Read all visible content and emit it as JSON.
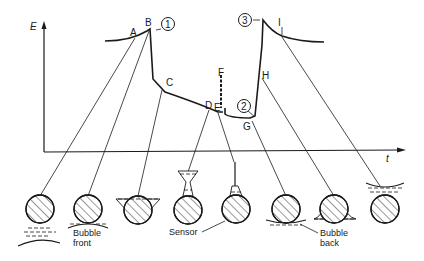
{
  "diagram": {
    "axes": {
      "y_label": "E",
      "x_label": "t"
    },
    "curve_points": [
      "A",
      "B",
      "C",
      "D",
      "E",
      "F",
      "G",
      "H",
      "I"
    ],
    "stage_markers": [
      "1",
      "2",
      "3"
    ],
    "captions": {
      "bubble_front_line1": "Bubble",
      "bubble_front_line2": "front",
      "sensor": "Sensor",
      "bubble_back_line1": "Bubble",
      "bubble_back_line2": "back"
    },
    "sensor_states_count": 9,
    "colors": {
      "ink": "#1a1a1a",
      "background": "#ffffff"
    }
  }
}
